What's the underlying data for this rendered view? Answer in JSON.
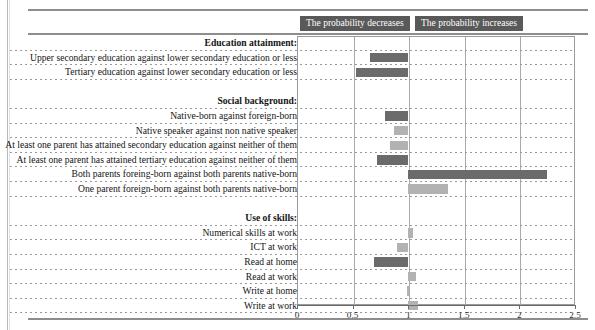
{
  "header": {
    "decrease_label": "The probability decreases",
    "increase_label": "The probability increases"
  },
  "axis": {
    "ticks": [
      "0",
      "0.5",
      "1",
      "1.5",
      "2",
      "2.5"
    ]
  },
  "chart_data": {
    "type": "bar",
    "orientation": "horizontal",
    "title": "",
    "xlabel": "",
    "ylabel": "",
    "xlim": [
      0,
      2.5
    ],
    "grid": true,
    "reference_value": 1,
    "legend_position": "top",
    "legend": [
      "The probability decreases",
      "The probability increases"
    ],
    "colors": {
      "dark": "#6b6b6b",
      "light": "#b2b2b2",
      "banner": "#595959"
    },
    "groups": [
      {
        "heading": "Education attainment:",
        "rows": [
          {
            "label": "Upper secondary education against lower secondary education or less",
            "start": 0.66,
            "end": 1.0,
            "shade": "dark"
          },
          {
            "label": "Tertiary education against lower secondary education or less",
            "start": 0.53,
            "end": 1.0,
            "shade": "dark"
          }
        ]
      },
      {
        "heading": "Social background:",
        "rows": [
          {
            "label": "Native-born against foreign-born",
            "start": 0.79,
            "end": 1.0,
            "shade": "dark"
          },
          {
            "label": "Native speaker against non native speaker",
            "start": 0.87,
            "end": 1.0,
            "shade": "light"
          },
          {
            "label": "At least one parent has attained secondary education against neither of them",
            "start": 0.84,
            "end": 1.0,
            "shade": "light"
          },
          {
            "label": "At least one parent has attained tertiary education against neither of them",
            "start": 0.72,
            "end": 1.0,
            "shade": "dark"
          },
          {
            "label": "Both parents foreing-born against both parents native-born",
            "start": 1.0,
            "end": 2.25,
            "shade": "dark"
          },
          {
            "label": "One parent foreign-born against both parents native-born",
            "start": 1.0,
            "end": 1.36,
            "shade": "light"
          }
        ]
      },
      {
        "heading": "Use of skills:",
        "rows": [
          {
            "label": "Numerical skills at work",
            "start": 1.0,
            "end": 1.04,
            "shade": "light"
          },
          {
            "label": "ICT at work",
            "start": 0.9,
            "end": 1.0,
            "shade": "light"
          },
          {
            "label": "Read at home",
            "start": 0.69,
            "end": 1.0,
            "shade": "dark"
          },
          {
            "label": "Read at work",
            "start": 1.0,
            "end": 1.07,
            "shade": "light"
          },
          {
            "label": "Write at home",
            "start": 0.99,
            "end": 1.0,
            "shade": "light"
          },
          {
            "label": "Write at work",
            "start": 1.0,
            "end": 1.09,
            "shade": "light"
          }
        ]
      }
    ]
  }
}
